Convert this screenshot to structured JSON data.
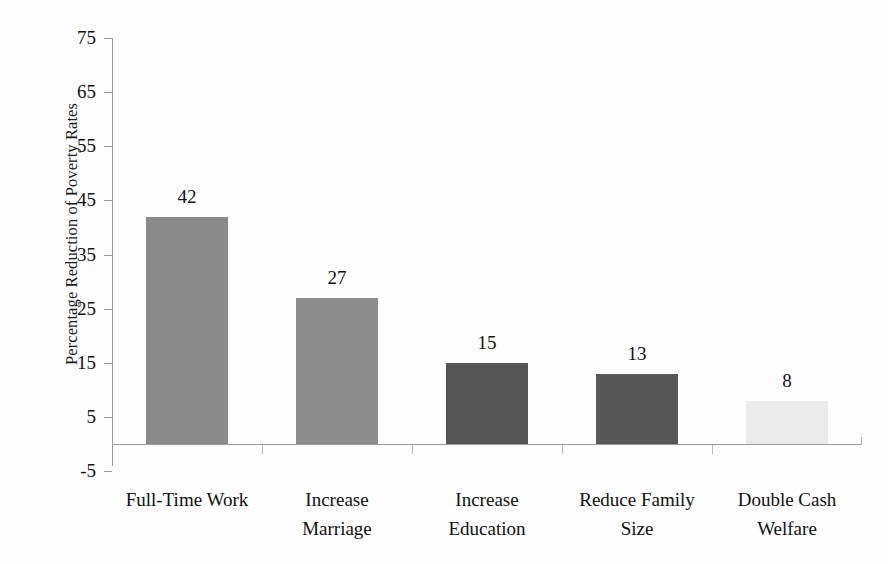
{
  "chart_data": {
    "type": "bar",
    "title": "",
    "subtitle": "",
    "xlabel": "",
    "ylabel": "Percentage Reduction of Poverty Rates",
    "categories": [
      "Full-Time Work",
      "Increase Marriage",
      "Increase Education",
      "Reduce Family Size",
      "Double Cash Welfare"
    ],
    "category_lines": [
      [
        "Full-Time Work"
      ],
      [
        "Increase",
        "Marriage"
      ],
      [
        "Increase",
        "Education"
      ],
      [
        "Reduce Family",
        "Size"
      ],
      [
        "Double Cash",
        "Welfare"
      ]
    ],
    "values": [
      42,
      27,
      15,
      13,
      8
    ],
    "value_labels": [
      "42",
      "27",
      "15",
      "13",
      "8"
    ],
    "ylim": [
      -5,
      75
    ],
    "yticks": [
      75,
      65,
      55,
      45,
      35,
      25,
      15,
      5,
      -5
    ],
    "ytick_labels": [
      "75",
      "65",
      "55",
      "45",
      "35",
      "25",
      "15",
      "5",
      "-5"
    ],
    "grid": false,
    "legend": "none",
    "bar_colors": [
      "#8a8a8a",
      "#8c8c8c",
      "#565656",
      "#585858",
      "#ebebeb"
    ]
  },
  "style": {
    "axis_color": "#9a9a9a",
    "tick_color": "#b6b6b6",
    "text_color": "#111111",
    "background": "#fdfdfd"
  }
}
